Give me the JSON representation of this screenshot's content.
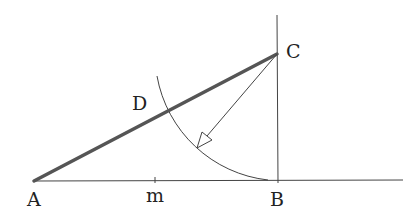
{
  "diagram": {
    "type": "geometric-construction",
    "points": {
      "A": {
        "label": "A",
        "x": 34,
        "y": 181
      },
      "B": {
        "label": "B",
        "x": 277,
        "y": 181
      },
      "C": {
        "label": "C",
        "x": 277,
        "y": 54
      },
      "D": {
        "label": "D",
        "x": 167,
        "y": 111
      },
      "m": {
        "label": "m",
        "x": 155,
        "y": 181
      }
    },
    "segments": [
      {
        "name": "AC",
        "from": "A",
        "to": "C",
        "style": "thick"
      },
      {
        "name": "baseline",
        "from": "A",
        "to": "end",
        "style": "thin"
      },
      {
        "name": "perpendicular-at-B",
        "style": "thin"
      },
      {
        "name": "CB-radius-arrow",
        "from": "C",
        "style": "arrow"
      }
    ],
    "arc": {
      "center": "C",
      "radius": 127,
      "from": "B",
      "through": "D"
    },
    "colors": {
      "line": "#333333",
      "thick": "#555555"
    }
  }
}
